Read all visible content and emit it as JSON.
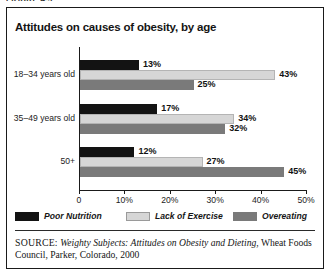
{
  "figure_caption": "FIGURE 4.3",
  "chart": {
    "title": "Attitudes on causes of obesity, by age"
  },
  "legend": {
    "items": [
      {
        "label": "Poor Nutrition",
        "color": "#131313"
      },
      {
        "label": "Lack of Exercise",
        "color": "#d6d6d6"
      },
      {
        "label": "Overeating",
        "color": "#7a7a7a"
      }
    ]
  },
  "source": {
    "label": "SOURCE:",
    "title": "Weighty Subjects: Attitudes on Obesity and Dieting",
    "rest": ", Wheat Foods Council, Parker, Colorado, 2000"
  },
  "chart_data": {
    "type": "bar",
    "orientation": "horizontal",
    "title": "Attitudes on causes of obesity, by age",
    "xlabel": "",
    "ylabel": "",
    "xlim": [
      0,
      50
    ],
    "xticks": [
      0,
      10,
      20,
      30,
      40,
      50
    ],
    "xtick_labels": [
      "0",
      "10%",
      "20%",
      "30%",
      "40%",
      "50%"
    ],
    "grid": false,
    "legend_position": "bottom",
    "categories": [
      "18–34 years old",
      "35–49 years old",
      "50+"
    ],
    "series": [
      {
        "name": "Poor Nutrition",
        "color": "#131313",
        "values": [
          13,
          17,
          12
        ],
        "labels": [
          "13%",
          "17%",
          "12%"
        ]
      },
      {
        "name": "Lack of Exercise",
        "color": "#d6d6d6",
        "values": [
          43,
          34,
          27
        ],
        "labels": [
          "43%",
          "34%",
          "27%"
        ]
      },
      {
        "name": "Overeating",
        "color": "#7a7a7a",
        "values": [
          25,
          32,
          45
        ],
        "labels": [
          "25%",
          "32%",
          "45%"
        ]
      }
    ]
  }
}
